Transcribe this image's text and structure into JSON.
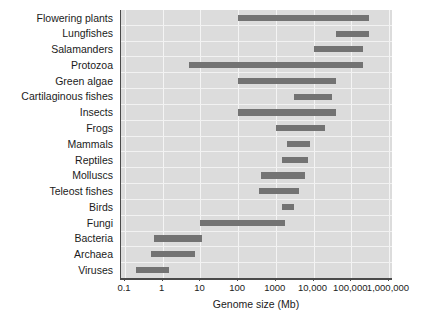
{
  "chart_data": {
    "type": "bar",
    "orientation": "horizontal",
    "subtype": "range-bar",
    "title": "",
    "xlabel": "Genome size (Mb)",
    "ylabel": "",
    "xscale": "log",
    "xlim": [
      0.1,
      1000000
    ],
    "xticks": [
      0.1,
      1,
      10,
      100,
      1000,
      10000,
      100000,
      1000000
    ],
    "xticklabels": [
      "0.1",
      "1",
      "10",
      "100",
      "1000",
      "10,000",
      "100,000",
      "1,000,000"
    ],
    "grid": true,
    "legend": false,
    "bar_color": "#737373",
    "plot_background": "#dcdcdc",
    "categories": [
      "Flowering plants",
      "Lungfishes",
      "Salamanders",
      "Protozoa",
      "Green algae",
      "Cartilaginous fishes",
      "Insects",
      "Frogs",
      "Mammals",
      "Reptiles",
      "Molluscs",
      "Teleost fishes",
      "Birds",
      "Fungi",
      "Bacteria",
      "Archaea",
      "Viruses"
    ],
    "ranges": [
      {
        "category": "Flowering plants",
        "min": 100,
        "max": 300000
      },
      {
        "category": "Lungfishes",
        "min": 40000,
        "max": 300000
      },
      {
        "category": "Salamanders",
        "min": 10000,
        "max": 200000
      },
      {
        "category": "Protozoa",
        "min": 5,
        "max": 200000
      },
      {
        "category": "Green algae",
        "min": 100,
        "max": 40000
      },
      {
        "category": "Cartilaginous fishes",
        "min": 3000,
        "max": 30000
      },
      {
        "category": "Insects",
        "min": 100,
        "max": 40000
      },
      {
        "category": "Frogs",
        "min": 1000,
        "max": 20000
      },
      {
        "category": "Mammals",
        "min": 2000,
        "max": 8000
      },
      {
        "category": "Reptiles",
        "min": 1500,
        "max": 7000
      },
      {
        "category": "Molluscs",
        "min": 400,
        "max": 6000
      },
      {
        "category": "Teleost fishes",
        "min": 350,
        "max": 4000
      },
      {
        "category": "Birds",
        "min": 1500,
        "max": 3000
      },
      {
        "category": "Fungi",
        "min": 10,
        "max": 1700
      },
      {
        "category": "Bacteria",
        "min": 0.6,
        "max": 11
      },
      {
        "category": "Archaea",
        "min": 0.5,
        "max": 7
      },
      {
        "category": "Viruses",
        "min": 0.2,
        "max": 1.5
      }
    ]
  }
}
